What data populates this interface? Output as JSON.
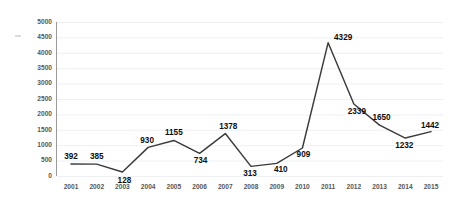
{
  "chart_data": {
    "type": "line",
    "title": "",
    "subtitle": "",
    "xlabel": "",
    "ylabel": "",
    "categories": [
      "2001",
      "2002",
      "2003",
      "2004",
      "2005",
      "2006",
      "2007",
      "2008",
      "2009",
      "2010",
      "2011",
      "2012",
      "2013",
      "2014",
      "2015"
    ],
    "values": [
      392,
      385,
      128,
      930,
      1155,
      734,
      1378,
      313,
      410,
      909,
      4329,
      2339,
      1650,
      1232,
      1442
    ],
    "series": [
      {
        "name": "",
        "values": [
          392,
          385,
          128,
          930,
          1155,
          734,
          1378,
          313,
          410,
          909,
          4329,
          2339,
          1650,
          1232,
          1442
        ]
      }
    ],
    "data_labels": [
      "392",
      "385",
      "128",
      "930",
      "1155",
      "734",
      "1378",
      "313",
      "410",
      "909",
      "4329",
      "2339",
      "1650",
      "1232",
      "1442"
    ],
    "ylim": [
      0,
      5000
    ],
    "ytick_labels": [
      "0",
      "500",
      "1000",
      "1500",
      "2000",
      "2500",
      "3000",
      "3500",
      "4000",
      "4500",
      "5000"
    ],
    "ytick_values": [
      0,
      500,
      1000,
      1500,
      2000,
      2500,
      3000,
      3500,
      4000,
      4500,
      5000
    ],
    "xtick_labels": [
      "2001",
      "2002",
      "2003",
      "2004",
      "2005",
      "2006",
      "2007",
      "2008",
      "2009",
      "2010",
      "2011",
      "2012",
      "2013",
      "2014",
      "2015"
    ],
    "grid": true,
    "grid_axis": "y",
    "legend": false,
    "legend_position": "none",
    "annotations": [],
    "colors": {
      "line": "#3b3b3b",
      "grid": "#ebedef",
      "axis": "#9a9a9a",
      "label_text": "#0d0d0d",
      "tick_text": "#565656",
      "background": "#ffffff"
    }
  },
  "label_offsets": [
    {
      "dx": 0,
      "dy": -5
    },
    {
      "dx": 0,
      "dy": -5
    },
    {
      "dx": 2,
      "dy": 11
    },
    {
      "dx": -1,
      "dy": -4
    },
    {
      "dx": 0,
      "dy": -5
    },
    {
      "dx": 1,
      "dy": 10
    },
    {
      "dx": 3,
      "dy": -5
    },
    {
      "dx": -1,
      "dy": 10
    },
    {
      "dx": 4,
      "dy": 9
    },
    {
      "dx": 1,
      "dy": 9
    },
    {
      "dx": 15,
      "dy": -3
    },
    {
      "dx": 3,
      "dy": 10
    },
    {
      "dx": 2,
      "dy": -5
    },
    {
      "dx": -1,
      "dy": 10
    },
    {
      "dx": -1,
      "dy": -4
    }
  ]
}
